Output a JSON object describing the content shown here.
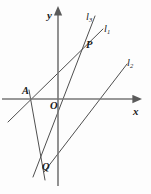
{
  "figure": {
    "kind": "coordinate-geometry-diagram",
    "background": "#fdfdfd",
    "stroke_color": "#4a4a4a",
    "axis_color": "#6e6e6e",
    "text_color": "#1a1a1a",
    "width": 151,
    "height": 194,
    "axes": {
      "origin": {
        "x": 58,
        "y": 99
      },
      "x_axis": {
        "label": "x",
        "from": {
          "x": 2,
          "y": 99
        },
        "to": {
          "x": 134,
          "y": 99
        },
        "arrow": "right"
      },
      "y_axis": {
        "label": "y",
        "from": {
          "x": 58,
          "y": 186
        },
        "to": {
          "x": 58,
          "y": 14
        },
        "arrow": "up"
      },
      "x_label_pos": {
        "x": 133,
        "y": 106
      },
      "y_label_pos": {
        "x": 47,
        "y": 10
      }
    },
    "points": [
      {
        "name": "A",
        "label": "A",
        "x": 31,
        "y": 99,
        "label_x": 22,
        "label_y": 86
      },
      {
        "name": "O",
        "label": "O",
        "x": 58,
        "y": 99,
        "label_x": 50,
        "label_y": 101
      },
      {
        "name": "P",
        "label": "P",
        "x": 84,
        "y": 45,
        "label_x": 86,
        "label_y": 40
      },
      {
        "name": "Q",
        "label": "Q",
        "x": 40,
        "y": 163,
        "label_x": 42,
        "label_y": 162
      }
    ],
    "lines": [
      {
        "name": "l1",
        "label": "l",
        "subscript": "1",
        "from": {
          "x": 8,
          "y": 122
        },
        "to": {
          "x": 103,
          "y": 29
        },
        "label_x": 104,
        "label_y": 24
      },
      {
        "name": "l3",
        "label": "l",
        "subscript": "3",
        "from": {
          "x": 33,
          "y": 177
        },
        "to": {
          "x": 95,
          "y": 16
        },
        "label_x": 86,
        "label_y": 12
      },
      {
        "name": "l2",
        "label": "l",
        "subscript": "2",
        "from": {
          "x": 44,
          "y": 172
        },
        "to": {
          "x": 127,
          "y": 64
        },
        "label_x": 127,
        "label_y": 58
      },
      {
        "name": "segment-AQ",
        "label": "",
        "subscript": "",
        "from": {
          "x": 29,
          "y": 90
        },
        "to": {
          "x": 45,
          "y": 180
        },
        "label_x": 0,
        "label_y": 0
      }
    ]
  }
}
